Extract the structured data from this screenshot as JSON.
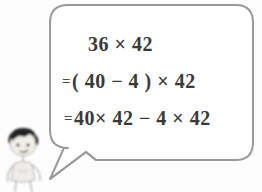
{
  "scene": {
    "type": "math-worksheet-illustration",
    "background_color": "#fdfdfd",
    "bubble_stroke_color": "#9a9a9a",
    "bubble_fill_color": "#ffffff",
    "text_color": "#3a3a3a"
  },
  "character": {
    "name": "cartoon-child",
    "description": "small sketched child with dark hair",
    "hair_color": "#2b2b2b",
    "sketch_color": "#b5b5b5"
  },
  "speech_bubble": {
    "name": "speech-bubble",
    "tail_direction": "down-left",
    "lines": [
      {
        "id": "line-1",
        "equals_prefix": "",
        "expression": "36 × 42"
      },
      {
        "id": "line-2",
        "equals_prefix": "=",
        "expression": "( 40 − 4 ) × 42"
      },
      {
        "id": "line-3",
        "equals_prefix": "=",
        "expression": "40× 42 − 4 × 42"
      }
    ]
  }
}
